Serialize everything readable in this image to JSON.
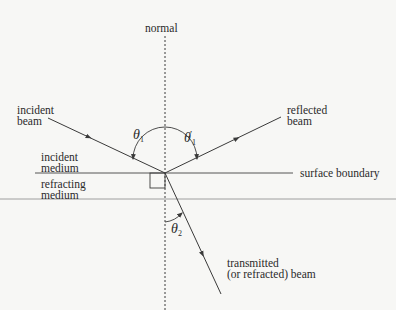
{
  "diagram": {
    "type": "reflection-refraction",
    "labels": {
      "normal": "normal",
      "incident_beam": "incident\nbeam",
      "reflected_beam": "reflected\nbeam",
      "incident_medium": "incident\nmedium",
      "refracting_medium": "refracting\nmedium",
      "surface_boundary": "surface boundary",
      "transmitted_beam": "transmitted\n(or refracted) beam"
    },
    "angles": {
      "theta1": {
        "symbol": "θ",
        "sub": "1"
      },
      "theta1_prime": {
        "symbol": "θ",
        "sub": "1",
        "prime": "′"
      },
      "theta2": {
        "symbol": "θ",
        "sub": "2"
      }
    },
    "colors": {
      "background": "#f7f7f5",
      "line": "#3a3a3a",
      "text": "#2a2a2a"
    }
  }
}
